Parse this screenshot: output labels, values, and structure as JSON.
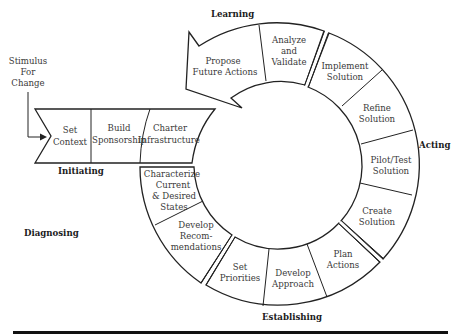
{
  "diagram": {
    "stimulus": {
      "lines": [
        "Stimulus",
        "For",
        "Change"
      ]
    },
    "phases": {
      "initiating": "Initiating",
      "diagnosing": "Diagnosing",
      "establishing": "Establishing",
      "acting": "Acting",
      "learning": "Learning"
    },
    "initiating_steps": [
      {
        "lines": [
          "Set",
          "Context"
        ]
      },
      {
        "lines": [
          "Build",
          "Sponsorship"
        ]
      },
      {
        "lines": [
          "Charter",
          "Infrastructure"
        ]
      }
    ],
    "diagnosing_steps": [
      {
        "lines": [
          "Characterize",
          "Current",
          "& Desired",
          "States"
        ]
      },
      {
        "lines": [
          "Develop",
          "Recom-",
          "mendations"
        ]
      }
    ],
    "establishing_steps": [
      {
        "lines": [
          "Set",
          "Priorities"
        ]
      },
      {
        "lines": [
          "Develop",
          "Approach"
        ]
      },
      {
        "lines": [
          "Plan",
          "Actions"
        ]
      }
    ],
    "acting_steps": [
      {
        "lines": [
          "Create",
          "Solution"
        ]
      },
      {
        "lines": [
          "Pilot/Test",
          "Solution"
        ]
      },
      {
        "lines": [
          "Refine",
          "Solution"
        ]
      },
      {
        "lines": [
          "Implement",
          "Solution"
        ]
      }
    ],
    "learning_steps": [
      {
        "lines": [
          "Analyze",
          "and",
          "Validate"
        ]
      },
      {
        "lines": [
          "Propose",
          "Future Actions"
        ]
      }
    ],
    "colors": {
      "stroke": "#222222",
      "text": "#3a3a3a",
      "background": "#ffffff"
    }
  }
}
